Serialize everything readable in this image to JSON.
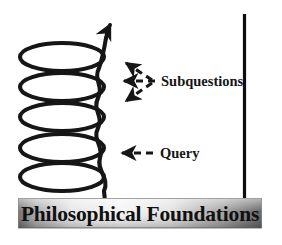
{
  "figure": {
    "type": "conceptual-diagram",
    "background_color": "#ffffff",
    "stroke_color": "#161616"
  },
  "spiral": {
    "name": "upward-helix",
    "coil_count": 5,
    "direction": "upward",
    "color": "#161616",
    "arrowhead": "up-right"
  },
  "axis": {
    "name": "vertical-axis-line",
    "color": "#0d0d0d",
    "orientation": "vertical"
  },
  "annotations": [
    {
      "id": "subquestions",
      "label": "Subquestions",
      "arrow_count": 3,
      "arrow_style": "dashed",
      "points_to": "helix-coils"
    },
    {
      "id": "query",
      "label": "Query",
      "arrow_count": 1,
      "arrow_style": "dashed",
      "points_to": "helix-base-coil"
    }
  ],
  "banner": {
    "label": "Philosophical Foundations",
    "gradient": {
      "from": "#6f6f6f",
      "mid": "#f2f2f2",
      "to": "#5f5f5f"
    },
    "border_color": "#7a7a7a"
  }
}
